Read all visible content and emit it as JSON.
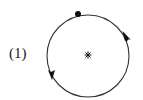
{
  "figure": {
    "label": "(1)",
    "orbit": {
      "shape": "circle",
      "direction": "counterclockwise",
      "center": [
        88,
        56
      ],
      "radius": 41
    },
    "center_marker": "asterisk",
    "start_point": "filled-dot-top",
    "colors": {
      "stroke": "#333333",
      "background": "#ffffff"
    }
  }
}
